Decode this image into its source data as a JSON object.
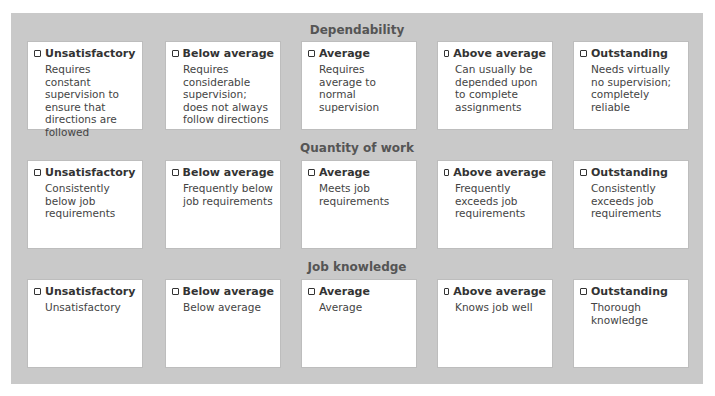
{
  "sections": [
    {
      "title": "Dependability",
      "ratings": [
        {
          "label": "Unsatisfactory",
          "description": "Requires constant supervision to ensure that directions are followed"
        },
        {
          "label": "Below average",
          "description": "Requires considerable supervision; does not always follow directions"
        },
        {
          "label": "Average",
          "description": "Requires average to normal supervision"
        },
        {
          "label": "Above average",
          "description": "Can usually be depended upon to complete assignments"
        },
        {
          "label": "Outstanding",
          "description": "Needs virtually no supervision; completely reliable"
        }
      ]
    },
    {
      "title": "Quantity of work",
      "ratings": [
        {
          "label": "Unsatisfactory",
          "description": "Consistently below job requirements"
        },
        {
          "label": "Below average",
          "description": "Frequently below job requirements"
        },
        {
          "label": "Average",
          "description": "Meets job requirements"
        },
        {
          "label": "Above average",
          "description": "Frequently exceeds job requirements"
        },
        {
          "label": "Outstanding",
          "description": "Consistently exceeds job requirements"
        }
      ]
    },
    {
      "title": "Job knowledge",
      "ratings": [
        {
          "label": "Unsatisfactory",
          "description": "Unsatisfactory"
        },
        {
          "label": "Below average",
          "description": "Below average"
        },
        {
          "label": "Average",
          "description": "Average"
        },
        {
          "label": "Above average",
          "description": "Knows job well"
        },
        {
          "label": "Outstanding",
          "description": "Thorough knowledge"
        }
      ]
    }
  ],
  "colors": {
    "panel": "#c9c9c9",
    "box": "#ffffff",
    "title_text": "#555555"
  }
}
